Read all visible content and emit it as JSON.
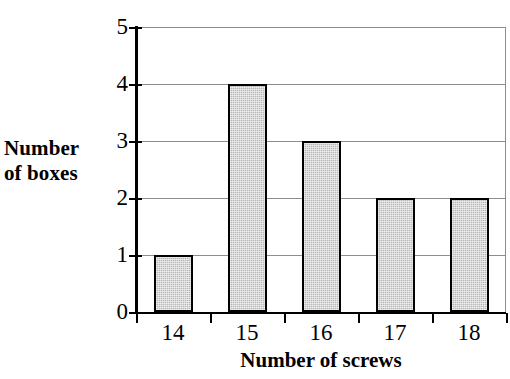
{
  "chart_data": {
    "type": "bar",
    "title": "",
    "xlabel": "Number of screws",
    "ylabel": "Number of boxes",
    "categories": [
      "14",
      "15",
      "16",
      "17",
      "18"
    ],
    "values": [
      1,
      4,
      3,
      2,
      2
    ],
    "ylim": [
      0,
      5
    ],
    "y_ticks": [
      "0",
      "1",
      "2",
      "3",
      "4",
      "5"
    ],
    "grid": true,
    "legend": "none",
    "bar_fill_color": "#b8b8b8",
    "bar_border_color": "#000000",
    "gridline_color": "#8d8d8d",
    "axis_color": "#000000",
    "background_color": "#ffffff"
  },
  "axis_titles": {
    "y_line1": "Number",
    "y_line2": "of boxes",
    "x": "Number of screws"
  }
}
